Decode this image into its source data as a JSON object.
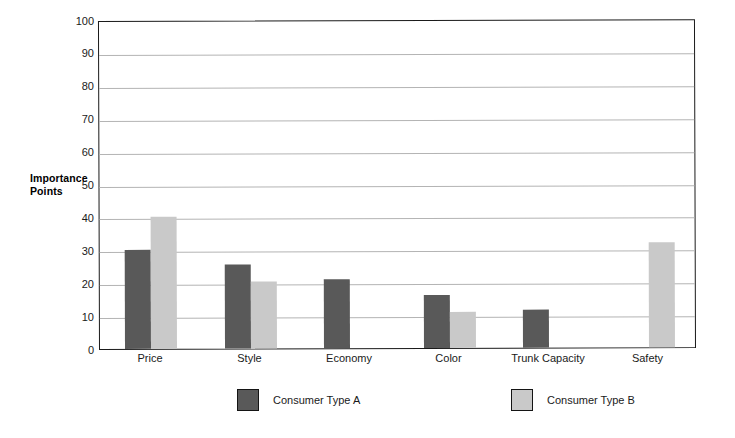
{
  "chart_data": {
    "type": "bar",
    "title": "",
    "xlabel": "",
    "ylabel": "Importance Points",
    "ylim": [
      0,
      100
    ],
    "ytick_step": 10,
    "yticks": [
      100,
      90,
      80,
      70,
      60,
      50,
      40,
      30,
      20,
      10,
      0
    ],
    "grid": "horizontal",
    "legend_position": "bottom",
    "categories": [
      "Price",
      "Style",
      "Economy",
      "Color",
      "Trunk Capacity",
      "Safety"
    ],
    "series": [
      {
        "name": "Consumer Type A",
        "color": "#595959",
        "values": [
          30,
          25.5,
          21,
          16,
          11.5,
          0
        ]
      },
      {
        "name": "Consumer Type B",
        "color": "#c9c9c9",
        "values": [
          40,
          20.5,
          0,
          11,
          0,
          32
        ]
      }
    ]
  },
  "axes": {
    "y_title_line1": "Importance",
    "y_title_line2": "Points"
  },
  "legend": {
    "entries": [
      {
        "label": "Consumer Type A",
        "swatch": "dark-gray-swatch"
      },
      {
        "label": "Consumer Type B",
        "swatch": "light-gray-swatch"
      }
    ]
  }
}
